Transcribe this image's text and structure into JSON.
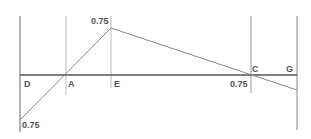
{
  "diagram": {
    "type": "shear-force-diagram",
    "colors": {
      "axis": "#666666",
      "gridline": "#bbbbbb",
      "plot_line": "#888888",
      "label": "#555555"
    },
    "point_labels": {
      "D": "D",
      "A": "A",
      "E": "E",
      "C": "C",
      "G": "G"
    },
    "value_labels": {
      "peak_E": "0.75",
      "min_D": "0.75",
      "near_C": "0.75"
    }
  }
}
